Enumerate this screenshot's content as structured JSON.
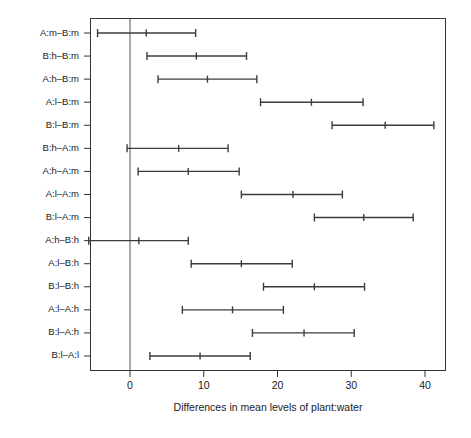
{
  "chart_data": {
    "type": "scatter",
    "plot_kind": "tukey-hsd-confidence-interval-plot",
    "title": "",
    "xlabel": "Differences in mean levels of plant:water",
    "ylabel": "",
    "xlim": [
      -7.5,
      42.8
    ],
    "ylim": [
      0,
      16
    ],
    "grid": false,
    "legend": null,
    "reference_line_x": 0,
    "xticks": [
      0,
      10,
      20,
      30,
      40
    ],
    "xtick_labels": [
      "0",
      "10",
      "20",
      "30",
      "40"
    ],
    "categories": [
      "A:m-B:m",
      "B:h-B:m",
      "A:h-B:m",
      "A:l-B:m",
      "B:l-B:m",
      "B:h-A:m",
      "A:h-A:m",
      "A:l-A:m",
      "B:l-A:m",
      "A:h-B:h",
      "A:l-B:h",
      "B:l-B:h",
      "A:l-A:h",
      "B:l-A:h",
      "B:l-A:l"
    ],
    "series": [
      {
        "name": "difference in means with 95% family-wise confidence interval",
        "center": [
          2.2,
          9.0,
          10.5,
          24.6,
          34.6,
          6.6,
          7.9,
          22.1,
          31.7,
          1.2,
          15.1,
          25.0,
          13.9,
          23.6,
          9.5
        ],
        "lower": [
          -4.4,
          2.3,
          3.8,
          17.7,
          27.4,
          -0.4,
          1.1,
          15.1,
          25.0,
          -5.6,
          8.3,
          18.1,
          7.1,
          16.6,
          2.7
        ],
        "upper": [
          8.9,
          15.8,
          17.2,
          31.6,
          41.2,
          13.3,
          14.8,
          28.8,
          38.4,
          7.9,
          22.0,
          31.8,
          20.8,
          30.4,
          16.3
        ]
      }
    ]
  },
  "colors": {
    "interval": "#3c3c3c",
    "frame": "#333333",
    "zero_line": "#555555",
    "background": "#ffffff",
    "text": "#1a1a1a"
  }
}
